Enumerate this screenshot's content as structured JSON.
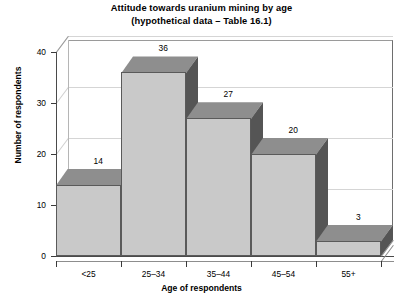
{
  "chart_data": {
    "type": "bar",
    "title": "Attitude towards uranium mining by age",
    "subtitle": "(hypothetical data – Table 16.1)",
    "xlabel": "Age of respondents",
    "ylabel": "Number of respondents",
    "categories": [
      "<25",
      "25–34",
      "35–44",
      "45–54",
      "55+"
    ],
    "values": [
      14,
      36,
      27,
      20,
      3
    ],
    "value_labels": [
      "14",
      "36",
      "27",
      "20",
      "3"
    ],
    "ylim": [
      0,
      40
    ],
    "yticks": [
      0,
      10,
      20,
      30,
      40
    ],
    "ytick_labels": [
      "0",
      "10",
      "20",
      "30",
      "40"
    ],
    "grid": true,
    "legend": "none",
    "style": "3d-column",
    "colors": {
      "bar_front": "#c9c9c9",
      "bar_side": "#555555",
      "bar_top": "#8e8e8e",
      "bar_outline": "#5a5a5a",
      "gridline": "#d5d5d5",
      "axis": "#4a4a4a",
      "wall": "#9a9a9a",
      "background": "#ffffff",
      "text": "#000000"
    }
  }
}
